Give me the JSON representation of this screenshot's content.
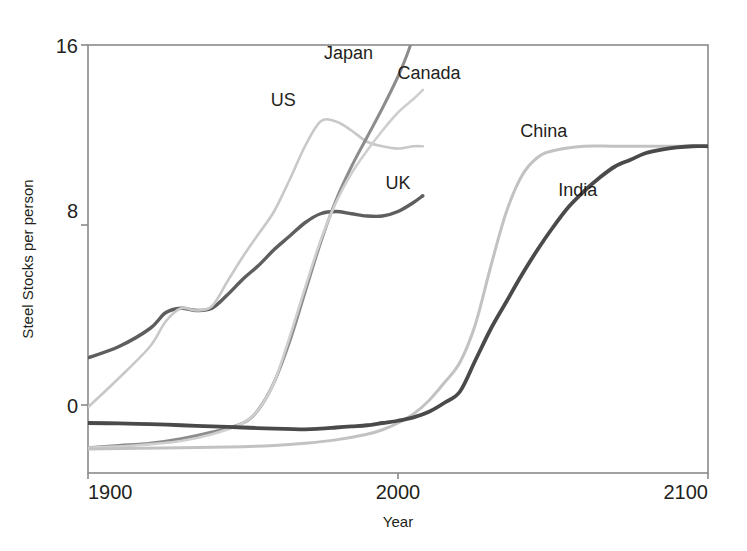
{
  "chart_data": {
    "type": "line",
    "title": "",
    "xlabel": "Year",
    "ylabel": "Steel Stocks per person",
    "xlim": [
      1900,
      2100
    ],
    "ylim": [
      -2.0,
      16.4
    ],
    "xticks": [
      "1900",
      "2000",
      "2100"
    ],
    "xtick_values": [
      1900,
      2000,
      2100
    ],
    "yticks": [
      "0",
      "8",
      "16"
    ],
    "ytick_values": [
      0,
      8,
      16
    ],
    "grid": false,
    "legend_position": "inline-annotations",
    "series": [
      {
        "name": "UK",
        "color": "#5e5e5e",
        "width": 3.4,
        "label_x": 2000,
        "label_y": 9.6,
        "x": [
          1900,
          1910,
          1920,
          1925,
          1930,
          1935,
          1940,
          1945,
          1950,
          1955,
          1960,
          1965,
          1970,
          1975,
          1980,
          1985,
          1990,
          1995,
          2000,
          2005,
          2008
        ],
        "y": [
          2.1,
          2.6,
          3.4,
          4.1,
          4.3,
          4.2,
          4.3,
          4.9,
          5.6,
          6.2,
          6.9,
          7.5,
          8.1,
          8.5,
          8.6,
          8.5,
          8.4,
          8.4,
          8.6,
          9.0,
          9.3
        ]
      },
      {
        "name": "US",
        "color": "#c8c8c8",
        "width": 2.6,
        "label_x": 1963,
        "label_y": 13.3,
        "x": [
          1900,
          1910,
          1920,
          1925,
          1930,
          1935,
          1940,
          1945,
          1950,
          1955,
          1960,
          1965,
          1970,
          1975,
          1980,
          1985,
          1990,
          1995,
          2000,
          2005,
          2008
        ],
        "y": [
          -0.1,
          1.2,
          2.6,
          3.7,
          4.3,
          4.2,
          4.4,
          5.5,
          6.6,
          7.6,
          8.6,
          10.0,
          11.5,
          12.6,
          12.6,
          12.2,
          11.7,
          11.5,
          11.4,
          11.5,
          11.5
        ]
      },
      {
        "name": "Japan",
        "color": "#8c8c8c",
        "width": 3.0,
        "label_x": 1984,
        "label_y": 15.4,
        "x": [
          1900,
          1910,
          1920,
          1930,
          1940,
          1950,
          1955,
          1960,
          1965,
          1970,
          1975,
          1980,
          1985,
          1990,
          1995,
          2000,
          2003,
          2005
        ],
        "y": [
          -1.9,
          -1.8,
          -1.7,
          -1.5,
          -1.2,
          -0.8,
          -0.2,
          1.0,
          2.8,
          5.0,
          7.2,
          9.1,
          10.6,
          11.9,
          13.2,
          14.6,
          15.6,
          16.4
        ]
      },
      {
        "name": "Canada",
        "color": "#cfcfcf",
        "width": 2.6,
        "label_x": 2010,
        "label_y": 14.5,
        "x": [
          1900,
          1915,
          1930,
          1940,
          1950,
          1955,
          1960,
          1965,
          1970,
          1975,
          1980,
          1985,
          1990,
          1995,
          2000,
          2005,
          2008
        ],
        "y": [
          -1.9,
          -1.8,
          -1.6,
          -1.3,
          -0.8,
          -0.2,
          1.0,
          3.0,
          5.2,
          7.3,
          9.0,
          10.3,
          11.3,
          12.2,
          13.0,
          13.6,
          14.0
        ]
      },
      {
        "name": "China",
        "color": "#c2c2c2",
        "width": 3.0,
        "label_x": 2047,
        "label_y": 11.9,
        "x": [
          1900,
          1930,
          1950,
          1960,
          1970,
          1980,
          1990,
          1995,
          2000,
          2005,
          2010,
          2015,
          2020,
          2025,
          2030,
          2035,
          2040,
          2045,
          2050,
          2060,
          2070,
          2080,
          2090,
          2100
        ],
        "y": [
          -1.95,
          -1.9,
          -1.85,
          -1.8,
          -1.7,
          -1.55,
          -1.3,
          -1.1,
          -0.8,
          -0.4,
          0.2,
          1.0,
          1.9,
          3.6,
          6.2,
          8.6,
          10.2,
          11.0,
          11.3,
          11.5,
          11.5,
          11.5,
          11.5,
          11.5
        ]
      },
      {
        "name": "India",
        "color": "#4a4a4a",
        "width": 3.8,
        "label_x": 2058,
        "label_y": 9.3,
        "x": [
          1900,
          1910,
          1920,
          1930,
          1940,
          1950,
          1960,
          1970,
          1975,
          1980,
          1985,
          1990,
          1995,
          2000,
          2005,
          2010,
          2015,
          2020,
          2025,
          2030,
          2035,
          2040,
          2045,
          2050,
          2055,
          2060,
          2065,
          2070,
          2075,
          2080,
          2085,
          2090,
          2095,
          2100
        ],
        "y": [
          -0.8,
          -0.82,
          -0.85,
          -0.9,
          -0.95,
          -1.0,
          -1.05,
          -1.08,
          -1.05,
          -1.0,
          -0.95,
          -0.9,
          -0.8,
          -0.7,
          -0.55,
          -0.3,
          0.1,
          0.6,
          2.0,
          3.4,
          4.6,
          5.8,
          6.9,
          7.9,
          8.8,
          9.5,
          10.1,
          10.6,
          10.9,
          11.2,
          11.35,
          11.45,
          11.5,
          11.5
        ]
      }
    ]
  },
  "axes": {
    "frame_color": "#808080"
  }
}
